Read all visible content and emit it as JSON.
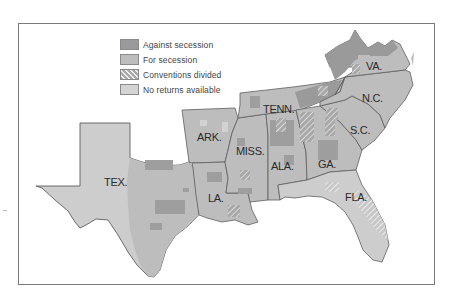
{
  "map": {
    "type": "choropleth",
    "subject": "Secession votes by county in the southern states",
    "colors": {
      "against_secession": "#9a9a9a",
      "for_secession": "#bdbdbd",
      "conventions_divided": "hatched",
      "no_returns_available": "#d2d2d2",
      "border": "#6e6e6e"
    }
  },
  "legend": {
    "items": [
      {
        "label": "Against secession",
        "key": "against"
      },
      {
        "label": "For secession",
        "key": "for"
      },
      {
        "label": "Conventions divided",
        "key": "divided"
      },
      {
        "label": "No returns available",
        "key": "none"
      }
    ]
  },
  "states": [
    {
      "label": "VA.",
      "x": 366,
      "y": 67
    },
    {
      "label": "N.C.",
      "x": 362,
      "y": 98
    },
    {
      "label": "TENN.",
      "x": 263,
      "y": 109
    },
    {
      "label": "S.C.",
      "x": 350,
      "y": 130
    },
    {
      "label": "ARK.",
      "x": 197,
      "y": 137
    },
    {
      "label": "MISS.",
      "x": 237,
      "y": 151
    },
    {
      "label": "GA.",
      "x": 318,
      "y": 164
    },
    {
      "label": "TEX.",
      "x": 104,
      "y": 182
    },
    {
      "label": "ALA.",
      "x": 272,
      "y": 164
    },
    {
      "label": "LA.",
      "x": 208,
      "y": 198
    },
    {
      "label": "FLA.",
      "x": 345,
      "y": 197
    }
  ]
}
